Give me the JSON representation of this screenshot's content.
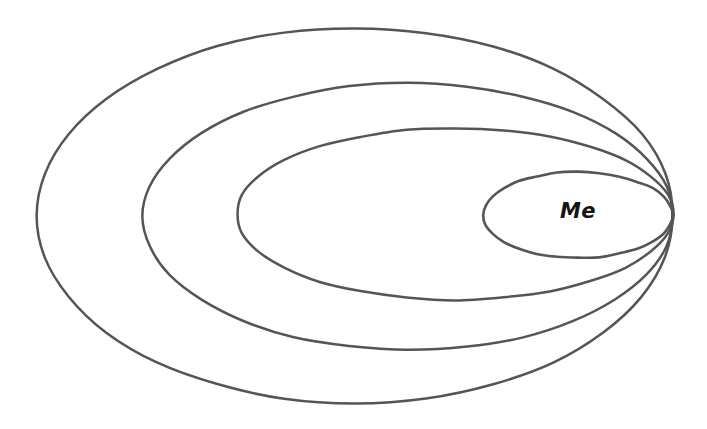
{
  "canvas": {
    "width": 707,
    "height": 429,
    "background_color": "#ffffff"
  },
  "style": {
    "stroke_color": "#555555",
    "label_color": "#141414",
    "stroke_width": 2.5,
    "inner_stroke_width": 2.6
  },
  "labels": {
    "center": "Me"
  },
  "chart_data": {
    "type": "diagram",
    "subtype": "nested-tangent-ellipses",
    "title": "",
    "tangent_point": {
      "x": 673,
      "y": 216
    },
    "ring_count": 4,
    "rings": [
      {
        "index": 1,
        "name": "outermost-ellipse",
        "label": "",
        "left_x": 37,
        "right_x": 673,
        "top_y": 28,
        "bottom_y": 403,
        "center_x": 355,
        "center_y": 215.5,
        "radius_x": 318,
        "radius_y": 187.5
      },
      {
        "index": 2,
        "name": "second-ellipse",
        "label": "",
        "left_x": 143,
        "right_x": 673,
        "top_y": 83,
        "bottom_y": 350,
        "center_x": 408,
        "center_y": 216.5,
        "radius_x": 265,
        "radius_y": 133.5
      },
      {
        "index": 3,
        "name": "third-ellipse",
        "label": "",
        "left_x": 237,
        "right_x": 673,
        "top_y": 128,
        "bottom_y": 300,
        "center_x": 455,
        "center_y": 214,
        "radius_x": 218,
        "radius_y": 86
      },
      {
        "index": 4,
        "name": "innermost-ellipse",
        "label": "Me",
        "left_x": 483,
        "right_x": 673,
        "top_y": 172,
        "bottom_y": 258,
        "center_x": 578,
        "center_y": 215,
        "radius_x": 95,
        "radius_y": 43
      }
    ],
    "label_position": {
      "x": 578,
      "y": 212,
      "font_size": 21
    }
  }
}
